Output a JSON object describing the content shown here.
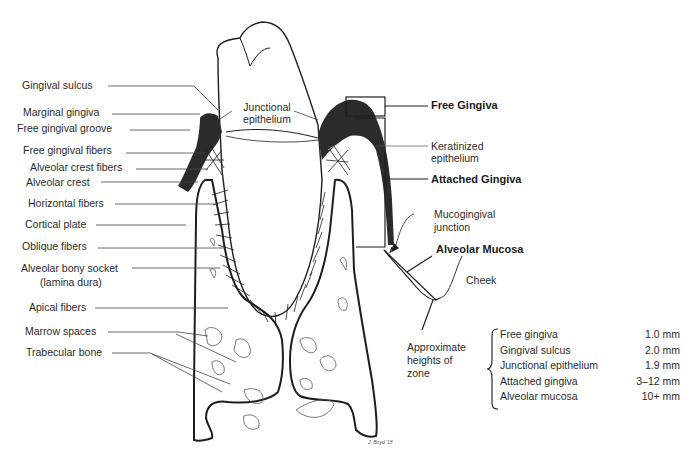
{
  "left_labels": {
    "gingival_sulcus": "Gingival sulcus",
    "marginal_gingiva": "Marginal gingiva",
    "free_gingival_groove": "Free gingival groove",
    "free_gingival_fibers": "Free gingival fibers",
    "alveolar_crest_fibers": "Alveolar crest fibers",
    "alveolar_crest": "Alveolar crest",
    "horizontal_fibers": "Horizontal fibers",
    "cortical_plate": "Cortical plate",
    "oblique_fibers": "Oblique fibers",
    "alveolar_bony_socket": "Alveolar bony socket",
    "lamina_dura": "(lamina dura)",
    "apical_fibers": "Apical fibers",
    "marrow_spaces": "Marrow spaces",
    "trabecular_bone": "Trabecular bone"
  },
  "center_labels": {
    "junctional_line1": "Junctional",
    "junctional_line2": "epithelium"
  },
  "right_labels": {
    "free_gingiva": "Free Gingiva",
    "keratinized_line1": "Keratinized",
    "keratinized_line2": "epithelium",
    "attached_gingiva": "Attached Gingiva",
    "mucogingival_line1": "Mucogingival",
    "mucogingival_line2": "junction",
    "alveolar_mucosa": "Alveolar Mucosa",
    "cheek": "Cheek",
    "approx_line1": "Approximate",
    "approx_line2": "heights of",
    "approx_line3": "zone"
  },
  "zone_heights": [
    {
      "zone": "Free gingiva",
      "height": "1.0 mm"
    },
    {
      "zone": "Gingival sulcus",
      "height": "2.0 mm"
    },
    {
      "zone": "Junctional epithelium",
      "height": "1.9 mm"
    },
    {
      "zone": "Attached gingiva",
      "height": "3–12 mm"
    },
    {
      "zone": "Alveolar mucosa",
      "height": "10+ mm"
    }
  ],
  "signature": "J. Boyd '18",
  "colors": {
    "line": "#1e1e1e",
    "gingiva": "#2b2b2b",
    "thin_line": "#555555"
  }
}
